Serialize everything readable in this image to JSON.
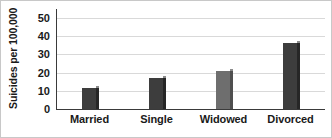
{
  "chart_data": {
    "type": "bar",
    "title": "",
    "xlabel": "",
    "ylabel": "Suicides per 100,000",
    "categories": [
      "Married",
      "Single",
      "Widowed",
      "Divorced"
    ],
    "values": [
      11.5,
      17,
      21,
      36.5
    ],
    "ylim": [
      0,
      55
    ],
    "yticks": [
      0,
      10,
      20,
      30,
      40,
      50
    ],
    "ytick_labels": [
      "0",
      "10",
      "20",
      "30",
      "40",
      "50"
    ],
    "grid": true,
    "legend": null,
    "series": [
      {
        "name": "Suicides per 100,000",
        "values": [
          11.5,
          17,
          21,
          36.5
        ]
      }
    ],
    "bar_colors": [
      "#3d3d3d",
      "#3d3d3d",
      "#6e6e6e",
      "#3d3d3d"
    ],
    "colors": {
      "bar_dark": "#3d3d3d",
      "bar_light": "#6e6e6e",
      "bar_side": "#262626",
      "gridline": "#d9d9d9",
      "axis": "#3a3a3a",
      "text": "#1a1a1a",
      "background": "#ffffff",
      "border": "#c8c8c8"
    }
  }
}
